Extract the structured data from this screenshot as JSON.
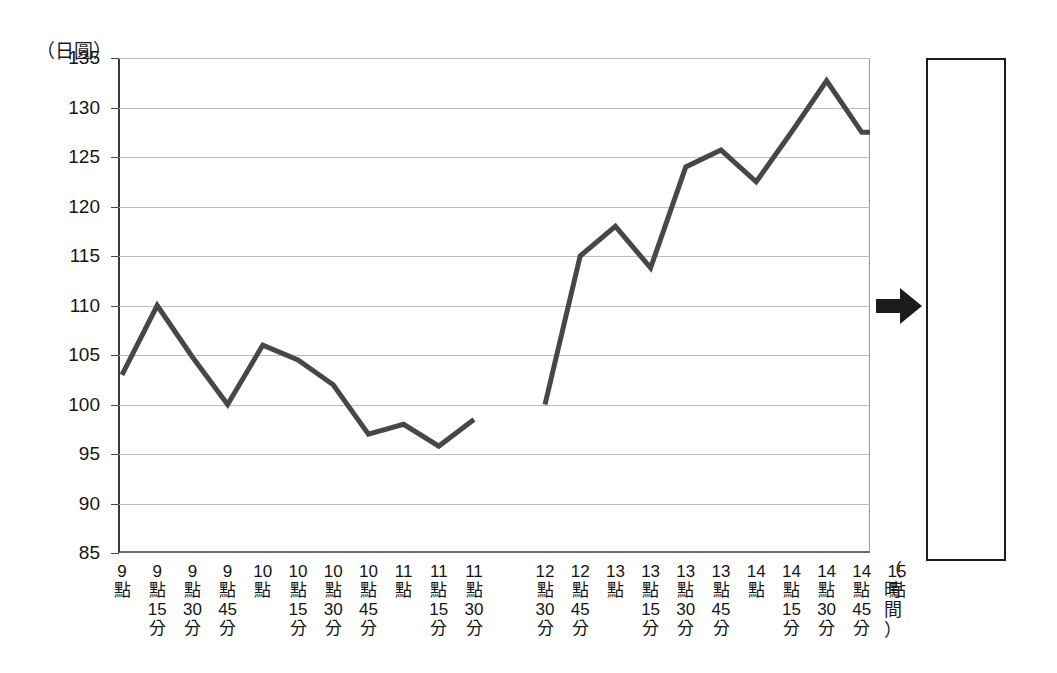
{
  "chart_data": {
    "type": "line",
    "title": "",
    "subtitle": "",
    "xlabel": "（時間）",
    "ylabel": "（日圓）",
    "ylim": [
      85,
      135
    ],
    "yticks": [
      85,
      90,
      95,
      100,
      105,
      110,
      115,
      120,
      125,
      130,
      135
    ],
    "grid": true,
    "legend": null,
    "categories": [
      "9點",
      "9點15分",
      "9點30分",
      "9點45分",
      "10點",
      "10點15分",
      "10點30分",
      "10點45分",
      "11點",
      "11點15分",
      "11點30分",
      "",
      "",
      "",
      "12點30分",
      "12點45分",
      "13點",
      "13點15分",
      "13點30分",
      "13點45分",
      "14點",
      "14點15分",
      "14點30分",
      "14點45分",
      "15點"
    ],
    "series": [
      {
        "name": "日圓匯率（上午）",
        "color": "#474747",
        "x": [
          "9點",
          "9點15分",
          "9點30分",
          "9點45分",
          "10點",
          "10點15分",
          "10點30分",
          "10點45分",
          "11點",
          "11點15分",
          "11點30分"
        ],
        "values": [
          103.0,
          110.0,
          104.8,
          100.0,
          106.0,
          104.5,
          102.0,
          97.0,
          98.0,
          95.8,
          98.5
        ]
      },
      {
        "name": "日圓匯率（下午）",
        "color": "#474747",
        "x": [
          "12點30分",
          "12點45分",
          "13點",
          "13點15分",
          "13點30分",
          "13點45分",
          "14點",
          "14點15分",
          "14點30分",
          "14點45分",
          "15點"
        ],
        "values": [
          100.0,
          115.0,
          118.0,
          113.8,
          124.0,
          125.7,
          122.5,
          127.5,
          132.7,
          127.5,
          127.5
        ]
      }
    ]
  },
  "axes": {
    "y_unit_label": "（日圓）",
    "x_unit_label_chars": [
      "（",
      "時",
      "間",
      "）"
    ],
    "y_tick_labels": [
      "135",
      "130",
      "125",
      "120",
      "115",
      "110",
      "105",
      "100",
      "95",
      "90",
      "85"
    ]
  },
  "x_tick_labels": [
    {
      "lines": [
        "9",
        "點",
        "",
        ""
      ]
    },
    {
      "lines": [
        "9",
        "點",
        "15",
        "分"
      ]
    },
    {
      "lines": [
        "9",
        "點",
        "30",
        "分"
      ]
    },
    {
      "lines": [
        "9",
        "點",
        "45",
        "分"
      ]
    },
    {
      "lines": [
        "10",
        "點",
        "",
        ""
      ]
    },
    {
      "lines": [
        "10",
        "點",
        "15",
        "分"
      ]
    },
    {
      "lines": [
        "10",
        "點",
        "30",
        "分"
      ]
    },
    {
      "lines": [
        "10",
        "點",
        "45",
        "分"
      ]
    },
    {
      "lines": [
        "11",
        "點",
        "",
        ""
      ]
    },
    {
      "lines": [
        "11",
        "點",
        "15",
        "分"
      ]
    },
    {
      "lines": [
        "11",
        "點",
        "30",
        "分"
      ]
    },
    {
      "lines": [
        "12",
        "點",
        "30",
        "分"
      ]
    },
    {
      "lines": [
        "12",
        "點",
        "45",
        "分"
      ]
    },
    {
      "lines": [
        "13",
        "點",
        "",
        ""
      ]
    },
    {
      "lines": [
        "13",
        "點",
        "15",
        "分"
      ]
    },
    {
      "lines": [
        "13",
        "點",
        "30",
        "分"
      ]
    },
    {
      "lines": [
        "13",
        "點",
        "45",
        "分"
      ]
    },
    {
      "lines": [
        "14",
        "點",
        "",
        ""
      ]
    },
    {
      "lines": [
        "14",
        "點",
        "15",
        "分"
      ]
    },
    {
      "lines": [
        "14",
        "點",
        "30",
        "分"
      ]
    },
    {
      "lines": [
        "14",
        "點",
        "45",
        "分"
      ]
    },
    {
      "lines": [
        "15",
        "點",
        "",
        ""
      ]
    }
  ],
  "decorations": {
    "arrow": {
      "name": "right-arrow",
      "color": "#1c1c1c",
      "direction": "right"
    },
    "result_box": {
      "name": "empty-answer-box",
      "text": "",
      "border_color": "#1c1c1c"
    }
  },
  "colors": {
    "line": "#474747",
    "grid": "#bcbcbc",
    "axis": "#3a3a3a",
    "text": "#161616",
    "ink": "#1c1c1c"
  }
}
